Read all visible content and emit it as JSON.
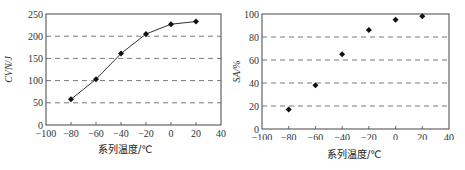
{
  "chart_data": [
    {
      "type": "line",
      "title": "",
      "xlabel": "系列温度/℃",
      "ylabel": "CVN/J",
      "x": [
        -80,
        -60,
        -40,
        -20,
        0,
        20
      ],
      "values": [
        58,
        103,
        161,
        205,
        227,
        233
      ],
      "xlim": [
        -100,
        40
      ],
      "ylim": [
        0,
        250
      ],
      "xticks": [
        "-100",
        "-80",
        "-60",
        "-40",
        "-20",
        "0",
        "20",
        "40"
      ],
      "yticks": [
        "0",
        "50",
        "100",
        "150",
        "200",
        "250"
      ],
      "grid": "horizontal dashed",
      "markers": "filled diamonds, connected by line",
      "legend": "none"
    },
    {
      "type": "scatter",
      "title": "",
      "xlabel": "系列温度/℃",
      "ylabel": "SA/%",
      "x": [
        -80,
        -60,
        -40,
        -20,
        0,
        20
      ],
      "values": [
        17,
        38,
        65,
        86,
        95,
        98
      ],
      "xlim": [
        -100,
        40
      ],
      "ylim": [
        0,
        100
      ],
      "xticks": [
        "-100",
        "-80",
        "-60",
        "-40",
        "-20",
        "0",
        "20",
        "40"
      ],
      "yticks": [
        "0",
        "20",
        "40",
        "60",
        "80",
        "100"
      ],
      "grid": "horizontal dashed",
      "markers": "filled diamonds, no line",
      "legend": "none"
    }
  ],
  "left": {
    "ylabel": "CVN/J",
    "xlabel": "系列温度/℃"
  },
  "right": {
    "ylabel": "SA/%",
    "xlabel": "系列温度/℃"
  }
}
